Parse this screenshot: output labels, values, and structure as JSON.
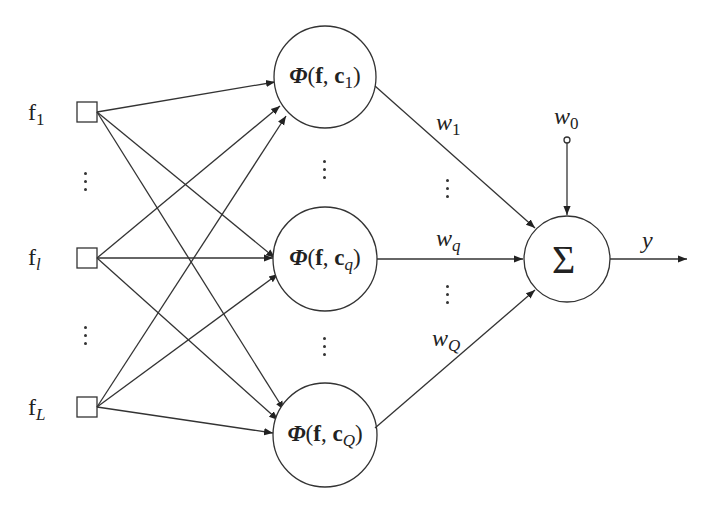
{
  "diagram": {
    "type": "RBF neural network",
    "inputs": [
      {
        "label": "f",
        "subscript": "1"
      },
      {
        "label": "f",
        "subscript": "l"
      },
      {
        "label": "f",
        "subscript": "L"
      }
    ],
    "hidden_nodes": [
      {
        "func": "Φ",
        "arg1": "f",
        "arg2": "c",
        "subscript": "1"
      },
      {
        "func": "Φ",
        "arg1": "f",
        "arg2": "c",
        "subscript": "q"
      },
      {
        "func": "Φ",
        "arg1": "f",
        "arg2": "c",
        "subscript": "Q"
      }
    ],
    "weights": [
      {
        "label": "w",
        "subscript": "1"
      },
      {
        "label": "w",
        "subscript": "q"
      },
      {
        "label": "w",
        "subscript": "Q"
      }
    ],
    "bias": {
      "label": "w",
      "subscript": "0"
    },
    "sum_symbol": "Σ",
    "output": {
      "label": "y"
    }
  }
}
